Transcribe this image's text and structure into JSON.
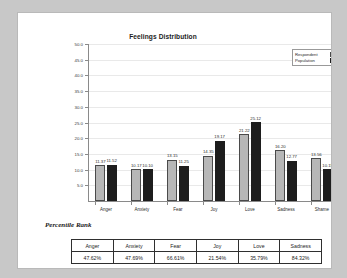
{
  "chart_data": {
    "type": "bar",
    "title": "Feelings Distribution",
    "xlabel": "",
    "ylabel": "",
    "ylim": [
      0,
      50
    ],
    "ytick_step": 5,
    "grid": true,
    "legend_position": "top-right",
    "categories": [
      "Anger",
      "Anxiety",
      "Fear",
      "Joy",
      "Love",
      "Sadness",
      "Shame"
    ],
    "yticks": [
      "5.0",
      "10.0",
      "15.0",
      "20.0",
      "25.0",
      "30.0",
      "35.0",
      "40.0",
      "45.0",
      "50.0"
    ],
    "series": [
      {
        "name": "Respondent",
        "color": "#b7b7b7",
        "values": [
          11.37,
          10.17,
          13.15,
          14.35,
          21.22,
          16.2,
          13.56
        ],
        "labels": [
          "11.37",
          "10.17",
          "13.15",
          "14.35",
          "21.22",
          "16.20",
          "13.56"
        ]
      },
      {
        "name": "Population",
        "color": "#1d1d1d",
        "values": [
          11.52,
          10.1,
          11.25,
          19.17,
          25.12,
          12.77,
          10.15
        ],
        "labels": [
          "11.52",
          "10.10",
          "11.25",
          "19.17",
          "25.12",
          "12.77",
          "10.15"
        ]
      }
    ]
  },
  "caption": {
    "text": "Percentile Rank"
  },
  "table": {
    "headers": [
      "Anger",
      "Anxiety",
      "Fear",
      "Joy",
      "Love",
      "Sadness"
    ],
    "values": [
      "47.62%",
      "47.69%",
      "66.61%",
      "21.54%",
      "35.79%",
      "84.32%"
    ]
  }
}
